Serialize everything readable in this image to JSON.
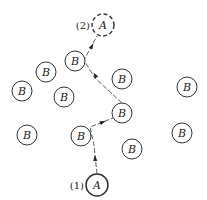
{
  "diagram": {
    "title": "",
    "nodes": [
      {
        "id": "A1",
        "label": "A",
        "tag": "(1)",
        "x": 97,
        "y": 185,
        "r": 11,
        "style": "solid-bold"
      },
      {
        "id": "A2",
        "label": "A",
        "tag": "(2)",
        "x": 103,
        "y": 25,
        "r": 11,
        "style": "dashed"
      },
      {
        "id": "B1",
        "label": "B",
        "x": 75,
        "y": 61,
        "r": 10
      },
      {
        "id": "B2",
        "label": "B",
        "x": 46,
        "y": 72,
        "r": 10
      },
      {
        "id": "B3",
        "label": "B",
        "x": 22,
        "y": 91,
        "r": 10
      },
      {
        "id": "B4",
        "label": "B",
        "x": 64,
        "y": 97,
        "r": 10
      },
      {
        "id": "B5",
        "label": "B",
        "x": 122,
        "y": 79,
        "r": 10
      },
      {
        "id": "B6",
        "label": "B",
        "x": 187,
        "y": 87,
        "r": 10
      },
      {
        "id": "B7",
        "label": "B",
        "x": 122,
        "y": 113,
        "r": 10
      },
      {
        "id": "B8",
        "label": "B",
        "x": 27,
        "y": 135,
        "r": 10
      },
      {
        "id": "B9",
        "label": "B",
        "x": 81,
        "y": 136,
        "r": 10
      },
      {
        "id": "B10",
        "label": "B",
        "x": 132,
        "y": 149,
        "r": 10
      },
      {
        "id": "B11",
        "label": "B",
        "x": 182,
        "y": 133,
        "r": 10
      }
    ],
    "path": {
      "description": "dashed trajectory of A from (1) to (2) bouncing off B molecules",
      "points": [
        [
          97,
          174
        ],
        [
          94,
          145
        ],
        [
          90,
          127
        ],
        [
          113,
          118
        ],
        [
          123,
          104
        ],
        [
          94,
          77
        ],
        [
          84,
          60
        ],
        [
          97,
          36
        ]
      ],
      "arrows": [
        [
          95,
          158
        ],
        [
          103,
          122
        ],
        [
          92,
          46
        ],
        [
          95,
          75
        ]
      ]
    },
    "labels": {
      "start": "(1)",
      "end": "(2)"
    }
  }
}
